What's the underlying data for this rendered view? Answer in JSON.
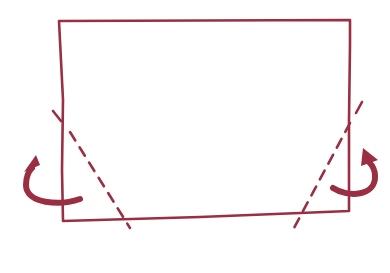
{
  "diagram": {
    "type": "fold-instruction",
    "colors": {
      "stroke": "#9a2f43",
      "background": "#ffffff"
    },
    "elements": [
      {
        "kind": "paper-outline",
        "shape": "rectangle"
      },
      {
        "kind": "valley-fold-line",
        "side": "left",
        "style": "dashed"
      },
      {
        "kind": "valley-fold-line",
        "side": "right",
        "style": "dashed"
      },
      {
        "kind": "fold-arrow",
        "side": "left",
        "direction": "behind-up"
      },
      {
        "kind": "fold-arrow",
        "side": "right",
        "direction": "behind-up"
      }
    ]
  }
}
